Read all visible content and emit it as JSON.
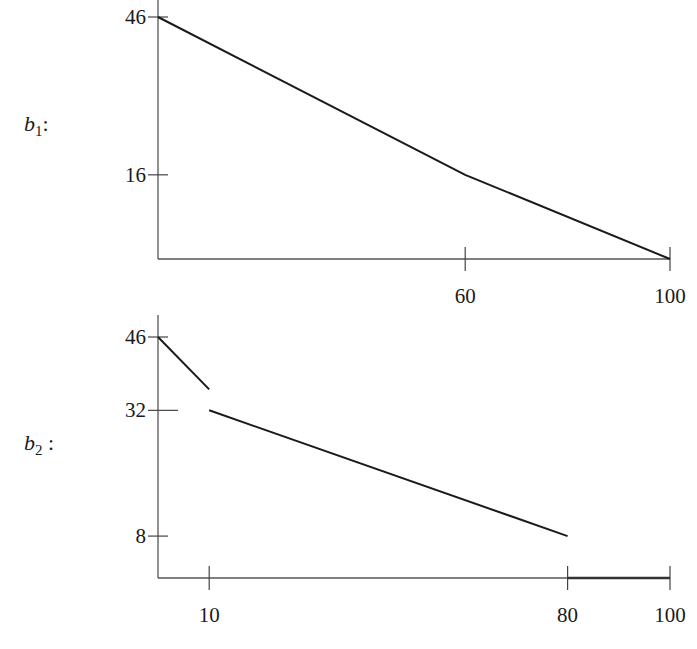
{
  "chart_data": [
    {
      "type": "line",
      "name": "b1",
      "series_label": {
        "base": "b",
        "sub": "1",
        "suffix": ":"
      },
      "xlabel": "",
      "ylabel": "",
      "xlim": [
        0,
        100
      ],
      "ylim": [
        0,
        46
      ],
      "x_ticks": [
        {
          "value": 60,
          "label": "60"
        },
        {
          "value": 100,
          "label": "100"
        }
      ],
      "y_ticks": [
        {
          "value": 46,
          "label": "46"
        },
        {
          "value": 16,
          "label": "16"
        }
      ],
      "segments": [
        {
          "points": [
            [
              0,
              46
            ],
            [
              60,
              16
            ],
            [
              100,
              0
            ]
          ],
          "style": "line"
        }
      ],
      "grid": false
    },
    {
      "type": "line",
      "name": "b2",
      "series_label": {
        "base": "b",
        "sub": "2",
        "suffix": " :"
      },
      "xlabel": "",
      "ylabel": "",
      "xlim": [
        0,
        100
      ],
      "ylim": [
        0,
        46
      ],
      "x_ticks": [
        {
          "value": 10,
          "label": "10"
        },
        {
          "value": 80,
          "label": "80"
        },
        {
          "value": 100,
          "label": "100"
        }
      ],
      "y_ticks": [
        {
          "value": 46,
          "label": "46"
        },
        {
          "value": 32,
          "label": "32"
        },
        {
          "value": 8,
          "label": "8"
        }
      ],
      "segments": [
        {
          "points": [
            [
              0,
              46
            ],
            [
              10,
              36
            ]
          ],
          "style": "line"
        },
        {
          "points": [
            [
              10,
              32
            ],
            [
              80,
              8
            ]
          ],
          "style": "line"
        },
        {
          "points": [
            [
              80,
              0
            ],
            [
              100,
              0
            ]
          ],
          "style": "zero"
        }
      ],
      "grid": false
    }
  ],
  "layout": {
    "panels": [
      {
        "x0": 158,
        "x1": 670,
        "y_zero": 259,
        "y_top_value": 46,
        "y_top_px": 17,
        "axis_top_px": 0,
        "label_x": 24,
        "label_y": 131
      },
      {
        "x0": 158,
        "x1": 670,
        "y_zero": 578,
        "y_top_value": 46,
        "y_top_px": 337,
        "axis_top_px": 315,
        "label_x": 24,
        "label_y": 450
      }
    ]
  }
}
